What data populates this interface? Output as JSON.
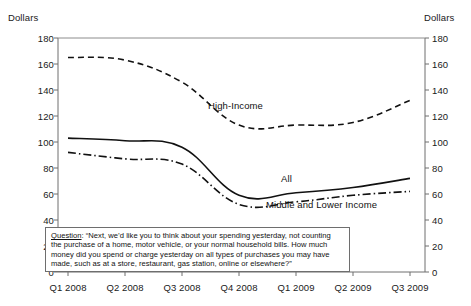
{
  "chart_data": {
    "type": "line",
    "title": "",
    "subtitle": "",
    "xlabel": "",
    "ylabel": "Dollars",
    "ylabel_right": "Dollars",
    "ylim": [
      0,
      180
    ],
    "ytick_step": 20,
    "grid": false,
    "legend_position": "inline-annotations",
    "categories": [
      "Q1 2008",
      "Q2 2008",
      "Q3 2008",
      "Q4 2008",
      "Q1 2009",
      "Q2 2009",
      "Q3 2009"
    ],
    "yticks": [
      "0",
      "20",
      "40",
      "60",
      "80",
      "100",
      "120",
      "140",
      "160",
      "180"
    ],
    "series": [
      {
        "name": "High-Income",
        "style": "dashed",
        "color": "#111111",
        "values": [
          165,
          163,
          146,
          113,
          113,
          115,
          132
        ]
      },
      {
        "name": "All",
        "style": "solid",
        "color": "#111111",
        "values": [
          103,
          101,
          96,
          59,
          61,
          65,
          72
        ]
      },
      {
        "name": "Middle and Lower Income",
        "style": "dash-dot",
        "color": "#111111",
        "values": [
          92,
          87,
          83,
          52,
          54,
          59,
          62
        ]
      }
    ],
    "annotations": [
      {
        "name": "high-income-label",
        "text": "High-Income"
      },
      {
        "name": "all-label",
        "text": "All"
      },
      {
        "name": "middle-lower-label",
        "text": "Middle and Lower Income"
      }
    ]
  },
  "axes": {
    "left_title": "Dollars",
    "right_title": "Dollars",
    "left_ticks": [
      "180",
      "160",
      "140",
      "120",
      "100",
      "80",
      "60",
      "40",
      "20",
      "0"
    ],
    "right_ticks": [
      "180",
      "160",
      "140",
      "120",
      "100",
      "80",
      "60",
      "40",
      "20",
      "0"
    ],
    "x_ticks": [
      "Q1 2008",
      "Q2 2008",
      "Q3 2008",
      "Q4 2008",
      "Q1 2009",
      "Q2 2009",
      "Q3 2009"
    ]
  },
  "note": {
    "label": "Question",
    "line1": ": “Next, we’d like you to think about your spending yesterday, not counting",
    "line2": "the purchase of a home, motor vehicle, or your normal household bills. How much",
    "line3": "money did you spend or charge yesterday on all types of purchases you may have",
    "line4": "made, such as at a store, restaurant, gas station, online or elsewhere?”"
  }
}
